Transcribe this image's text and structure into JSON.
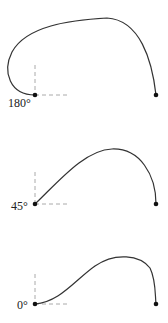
{
  "diagrams": [
    {
      "label": "180°",
      "start": [
        35,
        95
      ],
      "end": [
        156,
        95
      ],
      "path": "M35,95 C10,95 2,72 12,52 C26,26 70,20 107,18 C140,20 152,60 156,95"
    },
    {
      "label": "45°",
      "start": [
        35,
        204
      ],
      "end": [
        156,
        204
      ],
      "path": "M35,204 C60,180 85,150 112,149 C140,148 156,175 156,204"
    },
    {
      "label": "0°",
      "start": [
        35,
        304
      ],
      "end": [
        156,
        304
      ],
      "path": "M35,304 C60,302 75,280 95,266 C115,252 140,255 150,268 C156,280 155,295 156,304"
    }
  ],
  "colors": {
    "curve": "#333333",
    "dash": "#aaaaaa",
    "dot": "#111111"
  }
}
